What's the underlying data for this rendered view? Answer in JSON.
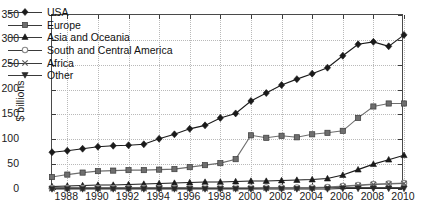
{
  "chart_data": {
    "type": "line",
    "title": "",
    "xlabel": "",
    "ylabel": "$ billions",
    "xlim": [
      1987,
      2010
    ],
    "ylim": [
      0,
      350
    ],
    "grid": true,
    "legend_position": "top-left",
    "x": [
      1987,
      1988,
      1989,
      1990,
      1991,
      1992,
      1993,
      1994,
      1995,
      1996,
      1997,
      1998,
      1999,
      2000,
      2001,
      2002,
      2003,
      2004,
      2005,
      2006,
      2007,
      2008,
      2009,
      2010
    ],
    "xtick_labels": [
      "1988",
      "1990",
      "1992",
      "1994",
      "1996",
      "1998",
      "2000",
      "2002",
      "2004",
      "2006",
      "2008",
      "2010"
    ],
    "xtick_values": [
      1988,
      1990,
      1992,
      1994,
      1996,
      1998,
      2000,
      2002,
      2004,
      2006,
      2008,
      2010
    ],
    "ytick_labels": [
      "0",
      "50",
      "100",
      "150",
      "200",
      "250",
      "300",
      "350"
    ],
    "ytick_values": [
      0,
      50,
      100,
      150,
      200,
      250,
      300,
      350
    ],
    "series": [
      {
        "name": "USA",
        "marker": "diamond",
        "color": "#1a1a1a",
        "values": [
          74,
          77,
          81,
          85,
          87,
          88,
          90,
          101,
          110,
          121,
          128,
          143,
          152,
          177,
          193,
          209,
          221,
          232,
          244,
          268,
          291,
          296,
          287,
          310
        ]
      },
      {
        "name": "Europe",
        "marker": "square",
        "color": "#6e6e6e",
        "values": [
          24,
          29,
          33,
          36,
          37,
          38,
          38,
          39,
          40,
          44,
          48,
          52,
          60,
          108,
          103,
          107,
          104,
          110,
          113,
          117,
          143,
          166,
          172,
          172
        ]
      },
      {
        "name": "Asia and Oceania",
        "marker": "triangle-up",
        "color": "#1a1a1a",
        "values": [
          5,
          6,
          7,
          8,
          8,
          9,
          10,
          11,
          12,
          13,
          14,
          14,
          15,
          16,
          16,
          17,
          18,
          19,
          21,
          28,
          39,
          50,
          59,
          68
        ]
      },
      {
        "name": "South and Central America",
        "marker": "circle-open",
        "color": "#8a8a8a",
        "values": [
          2,
          2,
          2,
          2,
          2,
          2,
          2,
          2,
          2,
          2,
          3,
          3,
          3,
          3,
          3,
          3,
          3,
          3,
          4,
          6,
          8,
          10,
          11,
          12
        ]
      },
      {
        "name": "Africa",
        "marker": "x",
        "color": "#5a5a5a",
        "values": [
          1,
          1,
          1,
          1,
          1,
          1,
          1,
          1,
          1,
          1,
          1,
          1,
          1,
          1,
          2,
          2,
          2,
          2,
          3,
          5,
          7,
          9,
          10,
          11
        ]
      },
      {
        "name": "Other",
        "marker": "triangle-down",
        "color": "#2a2a2a",
        "values": [
          0,
          0,
          0,
          0,
          0,
          0,
          0,
          0,
          0,
          0,
          0,
          0,
          0,
          0,
          0,
          0,
          0,
          0,
          0,
          1,
          1,
          1,
          1,
          1
        ]
      }
    ]
  },
  "legend": {
    "items": [
      {
        "label": "USA",
        "icon": "diamond-marker-icon"
      },
      {
        "label": "Europe",
        "icon": "square-marker-icon"
      },
      {
        "label": "Asia and Oceania",
        "icon": "triangle-up-marker-icon"
      },
      {
        "label": "South and Central America",
        "icon": "circle-open-marker-icon"
      },
      {
        "label": "Africa",
        "icon": "x-marker-icon"
      },
      {
        "label": "Other",
        "icon": "triangle-down-marker-icon"
      }
    ]
  },
  "axis": {
    "y_title": "$ billions"
  }
}
